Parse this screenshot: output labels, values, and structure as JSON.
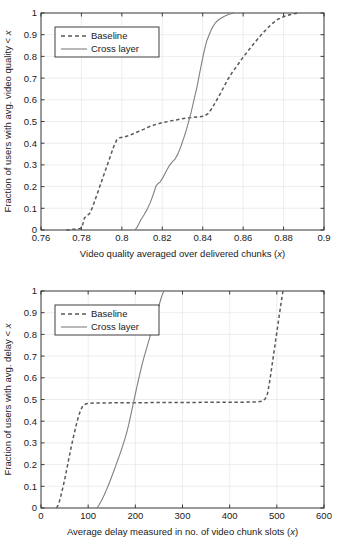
{
  "figure": {
    "type": "two-panel-cdf-figure",
    "panels": 2
  },
  "chart_data": [
    {
      "type": "line",
      "panel": "top",
      "title": "",
      "xlabel": "Video quality averaged over delivered chunks (x)",
      "ylabel": "Fraction of users with avg. video quality < x",
      "xlim": [
        0.76,
        0.9
      ],
      "ylim": [
        0,
        1
      ],
      "grid": true,
      "legend_position": "upper-left",
      "xticks": [
        "0.76",
        "0.78",
        "0.8",
        "0.82",
        "0.84",
        "0.86",
        "0.88",
        "0.9"
      ],
      "xtick_values": [
        0.76,
        0.78,
        0.8,
        0.82,
        0.84,
        0.86,
        0.88,
        0.9
      ],
      "yticks": [
        "0",
        "0.1",
        "0.2",
        "0.3",
        "0.4",
        "0.5",
        "0.6",
        "0.7",
        "0.8",
        "0.9",
        "1"
      ],
      "ytick_values": [
        0,
        0.1,
        0.2,
        0.3,
        0.4,
        0.5,
        0.6,
        0.7,
        0.8,
        0.9,
        1
      ],
      "series": [
        {
          "name": "Baseline",
          "style": "dashed",
          "color": "#595959",
          "points": [
            [
              0.7725,
              0.0
            ],
            [
              0.7755,
              0.003
            ],
            [
              0.7775,
              0.004
            ],
            [
              0.7795,
              0.007
            ],
            [
              0.7805,
              0.02
            ],
            [
              0.7815,
              0.055
            ],
            [
              0.7825,
              0.065
            ],
            [
              0.784,
              0.075
            ],
            [
              0.7855,
              0.105
            ],
            [
              0.787,
              0.145
            ],
            [
              0.7885,
              0.185
            ],
            [
              0.79,
              0.225
            ],
            [
              0.7915,
              0.265
            ],
            [
              0.793,
              0.305
            ],
            [
              0.7945,
              0.345
            ],
            [
              0.796,
              0.385
            ],
            [
              0.7975,
              0.415
            ],
            [
              0.799,
              0.425
            ],
            [
              0.801,
              0.428
            ],
            [
              0.8035,
              0.435
            ],
            [
              0.806,
              0.445
            ],
            [
              0.8085,
              0.455
            ],
            [
              0.811,
              0.465
            ],
            [
              0.814,
              0.478
            ],
            [
              0.817,
              0.487
            ],
            [
              0.82,
              0.495
            ],
            [
              0.823,
              0.5
            ],
            [
              0.826,
              0.506
            ],
            [
              0.829,
              0.511
            ],
            [
              0.832,
              0.516
            ],
            [
              0.835,
              0.519
            ],
            [
              0.838,
              0.521
            ],
            [
              0.8405,
              0.524
            ],
            [
              0.8425,
              0.535
            ],
            [
              0.8445,
              0.56
            ],
            [
              0.8465,
              0.592
            ],
            [
              0.8485,
              0.625
            ],
            [
              0.8505,
              0.66
            ],
            [
              0.8525,
              0.695
            ],
            [
              0.8545,
              0.725
            ],
            [
              0.857,
              0.757
            ],
            [
              0.8595,
              0.79
            ],
            [
              0.862,
              0.82
            ],
            [
              0.8645,
              0.85
            ],
            [
              0.867,
              0.878
            ],
            [
              0.8695,
              0.905
            ],
            [
              0.872,
              0.93
            ],
            [
              0.8745,
              0.952
            ],
            [
              0.877,
              0.97
            ],
            [
              0.88,
              0.983
            ],
            [
              0.883,
              0.992
            ],
            [
              0.886,
              0.998
            ],
            [
              0.888,
              1.0
            ]
          ]
        },
        {
          "name": "Cross layer",
          "style": "solid",
          "color": "#808080",
          "points": [
            [
              0.8065,
              0.0
            ],
            [
              0.8075,
              0.012
            ],
            [
              0.8085,
              0.03
            ],
            [
              0.8095,
              0.048
            ],
            [
              0.811,
              0.07
            ],
            [
              0.8125,
              0.095
            ],
            [
              0.814,
              0.125
            ],
            [
              0.8152,
              0.155
            ],
            [
              0.8162,
              0.183
            ],
            [
              0.817,
              0.205
            ],
            [
              0.8178,
              0.213
            ],
            [
              0.819,
              0.222
            ],
            [
              0.8205,
              0.245
            ],
            [
              0.822,
              0.272
            ],
            [
              0.8235,
              0.297
            ],
            [
              0.8248,
              0.313
            ],
            [
              0.8262,
              0.325
            ],
            [
              0.8278,
              0.352
            ],
            [
              0.8292,
              0.385
            ],
            [
              0.8305,
              0.42
            ],
            [
              0.8318,
              0.458
            ],
            [
              0.833,
              0.498
            ],
            [
              0.8342,
              0.54
            ],
            [
              0.8352,
              0.58
            ],
            [
              0.8362,
              0.62
            ],
            [
              0.8372,
              0.66
            ],
            [
              0.838,
              0.7
            ],
            [
              0.8388,
              0.738
            ],
            [
              0.8396,
              0.775
            ],
            [
              0.8404,
              0.81
            ],
            [
              0.8412,
              0.843
            ],
            [
              0.842,
              0.872
            ],
            [
              0.8432,
              0.9
            ],
            [
              0.8445,
              0.928
            ],
            [
              0.846,
              0.952
            ],
            [
              0.848,
              0.97
            ],
            [
              0.8505,
              0.984
            ],
            [
              0.853,
              0.994
            ],
            [
              0.8555,
              1.0
            ]
          ]
        }
      ]
    },
    {
      "type": "line",
      "panel": "bottom",
      "title": "",
      "xlabel": "Average delay measured in no. of video chunk slots (x)",
      "ylabel": "Fraction of users with avg. delay < x",
      "xlim": [
        0,
        600
      ],
      "ylim": [
        0,
        1
      ],
      "grid": true,
      "legend_position": "upper-left",
      "xticks": [
        "0",
        "100",
        "200",
        "300",
        "400",
        "500",
        "600"
      ],
      "xtick_values": [
        0,
        100,
        200,
        300,
        400,
        500,
        600
      ],
      "yticks": [
        "0",
        "0.1",
        "0.2",
        "0.3",
        "0.4",
        "0.5",
        "0.6",
        "0.7",
        "0.8",
        "0.9",
        "1"
      ],
      "ytick_values": [
        0,
        0.1,
        0.2,
        0.3,
        0.4,
        0.5,
        0.6,
        0.7,
        0.8,
        0.9,
        1
      ],
      "series": [
        {
          "name": "Baseline",
          "style": "dashed",
          "color": "#595959",
          "points": [
            [
              33,
              0.0
            ],
            [
              36,
              0.012
            ],
            [
              39,
              0.03
            ],
            [
              42,
              0.055
            ],
            [
              45,
              0.082
            ],
            [
              48,
              0.11
            ],
            [
              51,
              0.14
            ],
            [
              54,
              0.172
            ],
            [
              57,
              0.205
            ],
            [
              60,
              0.238
            ],
            [
              63,
              0.27
            ],
            [
              66,
              0.3
            ],
            [
              69,
              0.33
            ],
            [
              72,
              0.358
            ],
            [
              75,
              0.385
            ],
            [
              78,
              0.41
            ],
            [
              81,
              0.432
            ],
            [
              84,
              0.45
            ],
            [
              87,
              0.464
            ],
            [
              90,
              0.473
            ],
            [
              94,
              0.479
            ],
            [
              99,
              0.482
            ],
            [
              110,
              0.484
            ],
            [
              130,
              0.484
            ],
            [
              160,
              0.485
            ],
            [
              200,
              0.485
            ],
            [
              250,
              0.486
            ],
            [
              300,
              0.486
            ],
            [
              350,
              0.487
            ],
            [
              400,
              0.487
            ],
            [
              440,
              0.488
            ],
            [
              460,
              0.489
            ],
            [
              470,
              0.492
            ],
            [
              476,
              0.505
            ],
            [
              480,
              0.525
            ],
            [
              483,
              0.56
            ],
            [
              486,
              0.6
            ],
            [
              489,
              0.645
            ],
            [
              492,
              0.69
            ],
            [
              495,
              0.735
            ],
            [
              498,
              0.78
            ],
            [
              501,
              0.825
            ],
            [
              504,
              0.87
            ],
            [
              507,
              0.915
            ],
            [
              510,
              0.958
            ],
            [
              513,
              1.0
            ]
          ]
        },
        {
          "name": "Cross layer",
          "style": "solid",
          "color": "#808080",
          "points": [
            [
              118,
              0.0
            ],
            [
              122,
              0.01
            ],
            [
              126,
              0.025
            ],
            [
              130,
              0.042
            ],
            [
              134,
              0.06
            ],
            [
              138,
              0.08
            ],
            [
              142,
              0.1
            ],
            [
              146,
              0.122
            ],
            [
              150,
              0.145
            ],
            [
              154,
              0.168
            ],
            [
              158,
              0.192
            ],
            [
              162,
              0.216
            ],
            [
              166,
              0.24
            ],
            [
              170,
              0.265
            ],
            [
              174,
              0.292
            ],
            [
              178,
              0.32
            ],
            [
              182,
              0.35
            ],
            [
              186,
              0.385
            ],
            [
              190,
              0.425
            ],
            [
              194,
              0.465
            ],
            [
              198,
              0.505
            ],
            [
              202,
              0.545
            ],
            [
              206,
              0.585
            ],
            [
              210,
              0.622
            ],
            [
              214,
              0.658
            ],
            [
              218,
              0.692
            ],
            [
              222,
              0.722
            ],
            [
              226,
              0.752
            ],
            [
              230,
              0.782
            ],
            [
              234,
              0.812
            ],
            [
              238,
              0.842
            ],
            [
              242,
              0.872
            ],
            [
              246,
              0.902
            ],
            [
              250,
              0.932
            ],
            [
              254,
              0.962
            ],
            [
              258,
              0.988
            ],
            [
              261,
              1.0
            ]
          ]
        }
      ]
    }
  ],
  "legend": {
    "entries": [
      {
        "label": "Baseline",
        "style": "dashed"
      },
      {
        "label": "Cross layer",
        "style": "solid"
      }
    ]
  },
  "colors": {
    "baseline": "#595959",
    "cross_layer": "#808080",
    "grid": "#e8e8e8",
    "axis": "#2b2b2b",
    "background": "#ffffff"
  }
}
